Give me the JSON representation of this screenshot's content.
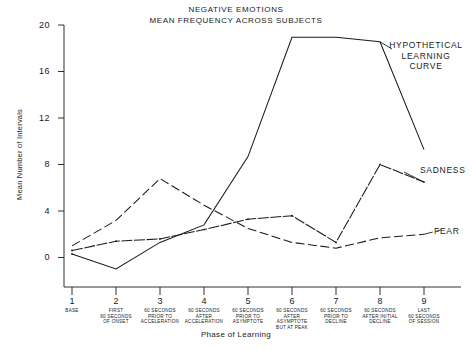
{
  "chart_data": {
    "type": "line",
    "title": "NEGATIVE EMOTIONS",
    "subtitle": "MEAN FREQUENCY ACROSS SUBJECTS",
    "xlabel": "Phase of Learning",
    "ylabel": "Mean Number of Intervals",
    "ylim": [
      -2,
      20
    ],
    "yticks": [
      0,
      4,
      8,
      12,
      16,
      20
    ],
    "ytick_labels": [
      "0",
      "4",
      "8",
      "12",
      "16",
      "20"
    ],
    "grid": false,
    "legend_position": "inline-right-of-curve",
    "x": [
      1,
      2,
      3,
      4,
      5,
      6,
      7,
      8,
      9
    ],
    "xtick_labels": [
      "1",
      "2",
      "3",
      "4",
      "5",
      "6",
      "7",
      "8",
      "9"
    ],
    "categories": [
      [
        "BASE"
      ],
      [
        "FIRST",
        "60 SECONDS",
        "OF ONSET"
      ],
      [
        "60 SECONDS",
        "PRIOR TO",
        "ACCELERATION"
      ],
      [
        "60 SECONDS",
        "AFTER",
        "ACCELERATION"
      ],
      [
        "60 SECONDS",
        "PRIOR TO",
        "ASYMPTOTE"
      ],
      [
        "60 SECONDS",
        "AFTER",
        "ASYMPTOTE",
        "BUT AT PEAK"
      ],
      [
        "60 SECONDS",
        "PRIOR TO",
        "DECLINE"
      ],
      [
        "60 SECONDS",
        "AFTER INITIAL",
        "DECLINE"
      ],
      [
        "LAST",
        "60 SECONDS",
        "OF SESSION"
      ]
    ],
    "series": [
      {
        "name": "HYPOTHETICAL LEARNING CURVE",
        "label_lines": [
          "HYPOTHETICAL",
          "LEARNING",
          "CURVE"
        ],
        "style": "solid",
        "color": "#1a1a1a",
        "values": [
          0.3,
          -1.0,
          1.3,
          2.8,
          8.7,
          19.0,
          19.0,
          18.6,
          9.3
        ]
      },
      {
        "name": "SADNESS",
        "label_lines": [
          "SADNESS"
        ],
        "style": "dotted",
        "color": "#1a1a1a",
        "values": [
          0.6,
          1.4,
          1.6,
          2.4,
          3.3,
          3.6,
          1.3,
          8.0,
          6.5
        ]
      },
      {
        "name": "FEAR",
        "label_lines": [
          "FEAR"
        ],
        "style": "dashed",
        "color": "#1a1a1a",
        "values": [
          1.0,
          3.2,
          6.8,
          4.5,
          2.5,
          1.3,
          0.8,
          1.7,
          2.0
        ]
      }
    ]
  },
  "axes": {
    "y_tick_0": "0",
    "y_tick_4": "4",
    "y_tick_8": "8",
    "y_tick_12": "12",
    "y_tick_16": "16",
    "y_tick_20": "20"
  },
  "labels": {
    "hypothetical_l1": "HYPOTHETICAL",
    "hypothetical_l2": "LEARNING",
    "hypothetical_l3": "CURVE",
    "sadness": "SADNESS",
    "fear": "FEAR"
  }
}
